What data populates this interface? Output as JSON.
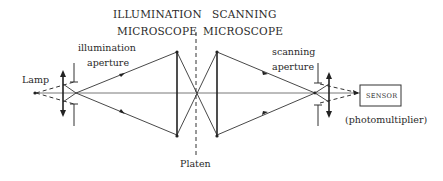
{
  "diagram": {
    "labels": {
      "illumination_microscope_line1": "ILLUMINATION",
      "illumination_microscope_line2": "MICROSCOPE",
      "scanning_microscope_line1": "SCANNING",
      "scanning_microscope_line2": "MICROSCOPE",
      "illumination_aperture_line1": "illumination",
      "illumination_aperture_line2": "aperture",
      "scanning_aperture_line1": "scanning",
      "scanning_aperture_line2": "aperture",
      "lamp": "Lamp",
      "platen": "Platen",
      "sensor": "SENSOR",
      "photomultiplier": "(photomultiplier)"
    },
    "components": [
      "lamp",
      "condenser-lens",
      "illumination-aperture",
      "illumination-lens",
      "platen",
      "scanning-lens",
      "scanning-aperture",
      "sensor-lens",
      "sensor"
    ]
  }
}
